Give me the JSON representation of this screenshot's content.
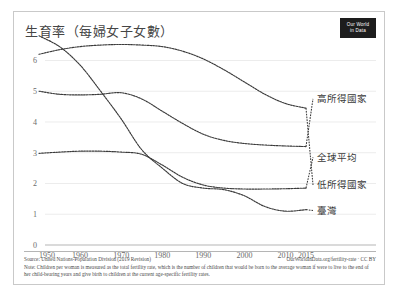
{
  "card": {
    "title": "生育率（每婦女子女數）",
    "logo": {
      "line1": "Our World",
      "line2": "in Data",
      "name": "our-world-in-data-logo"
    }
  },
  "footer": {
    "source": "Source: United Nations-Population Division (2019 Revision)",
    "attribution": "OurWorldInData.org/fertility-rate · CC BY",
    "note": "Note: Children per woman is measured as the total fertility rate, which is the number of children that would be born to the average woman if were to live to the end of her child-bearing years and give birth to children at the current age-specific fertility rates."
  },
  "chart_data": {
    "type": "line",
    "title": "生育率（每婦女子女數）",
    "xlabel": "",
    "ylabel": "",
    "xlim": [
      1950,
      2015
    ],
    "ylim": [
      0,
      6.6
    ],
    "grid": true,
    "legend_position": "right-inline",
    "y_ticks": [
      0,
      1,
      2,
      3,
      4,
      5,
      6
    ],
    "y_tick_labels": [
      "0",
      "1",
      "2",
      "3",
      "4",
      "5",
      "6"
    ],
    "x_ticks": [
      1950,
      1960,
      1970,
      1980,
      1990,
      2000,
      2010,
      2015
    ],
    "x_tick_labels": [
      "1950",
      "1960",
      "1970",
      "1980",
      "1990",
      "2000",
      "2010",
      "2015"
    ],
    "x": [
      1950,
      1955,
      1960,
      1965,
      1970,
      1975,
      1980,
      1985,
      1990,
      1995,
      2000,
      2005,
      2010,
      2015
    ],
    "series": [
      {
        "name": "低所得國家",
        "label": "低所得國家",
        "color": "#3b3b3b",
        "style": "dotted",
        "label_y_value": 1.95,
        "values": [
          6.2,
          6.35,
          6.45,
          6.5,
          6.52,
          6.5,
          6.45,
          6.3,
          6.05,
          5.7,
          5.3,
          4.9,
          4.6,
          4.45
        ]
      },
      {
        "name": "高所得國家",
        "label": "高所得國家",
        "color": "#3b3b3b",
        "style": "dotted",
        "label_y_value": 4.75,
        "values": [
          5.0,
          4.9,
          4.88,
          4.9,
          4.95,
          4.75,
          4.35,
          3.95,
          3.6,
          3.4,
          3.3,
          3.25,
          3.22,
          3.2
        ]
      },
      {
        "name": "全球平均",
        "label": "全球平均",
        "color": "#3b3b3b",
        "style": "dotted",
        "label_y_value": 2.85,
        "values": [
          2.98,
          3.02,
          3.05,
          3.05,
          3.02,
          2.95,
          2.6,
          2.2,
          1.95,
          1.85,
          1.82,
          1.82,
          1.83,
          1.85
        ]
      },
      {
        "name": "臺灣",
        "label": "臺灣",
        "color": "#3b3b3b",
        "style": "dotted",
        "label_y_value": 1.12,
        "values": [
          6.8,
          6.45,
          5.85,
          5.0,
          4.1,
          3.1,
          2.5,
          2.0,
          1.85,
          1.8,
          1.6,
          1.25,
          1.1,
          1.15
        ]
      }
    ]
  }
}
